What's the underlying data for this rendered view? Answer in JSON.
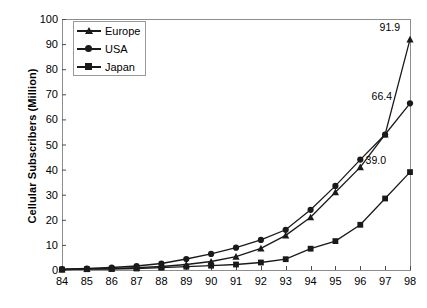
{
  "chart_data": {
    "type": "line",
    "title": "",
    "xlabel": "",
    "ylabel": "Cellular Subscribers (Million)",
    "x": [
      "84",
      "85",
      "86",
      "87",
      "88",
      "89",
      "90",
      "91",
      "92",
      "93",
      "94",
      "95",
      "96",
      "97",
      "98"
    ],
    "xlim": [
      84,
      98
    ],
    "ylim": [
      0,
      100
    ],
    "yticks": [
      "0",
      "10",
      "20",
      "30",
      "40",
      "50",
      "60",
      "70",
      "80",
      "90",
      "100"
    ],
    "ytick_values": [
      0,
      10,
      20,
      30,
      40,
      50,
      60,
      70,
      80,
      90,
      100
    ],
    "grid": false,
    "legend_position": "top-left-inside",
    "series": [
      {
        "name": "Europe",
        "marker": "triangle",
        "color": "#1a1a1a",
        "values": [
          0.2,
          0.4,
          0.6,
          0.9,
          1.4,
          2.2,
          3.4,
          5.3,
          8.6,
          13.8,
          21.0,
          31.0,
          41.0,
          54.0,
          91.9
        ],
        "end_label": "91.9"
      },
      {
        "name": "USA",
        "marker": "circle",
        "color": "#1a1a1a",
        "values": [
          0.3,
          0.6,
          1.0,
          1.6,
          2.6,
          4.4,
          6.4,
          8.9,
          12.0,
          16.0,
          24.0,
          33.5,
          44.0,
          54.0,
          66.4
        ],
        "end_label": "66.4"
      },
      {
        "name": "Japan",
        "marker": "square",
        "color": "#1a1a1a",
        "values": [
          0.2,
          0.3,
          0.4,
          0.6,
          0.9,
          1.3,
          1.7,
          2.2,
          3.0,
          4.3,
          8.5,
          11.5,
          18.0,
          28.5,
          39.0
        ],
        "end_label": "39.0"
      }
    ],
    "annotations": [
      {
        "text": "91.9",
        "series": "Europe",
        "x": "98"
      },
      {
        "text": "66.4",
        "series": "USA",
        "x": "98"
      },
      {
        "text": "39.0",
        "series": "Japan",
        "x": "98"
      }
    ]
  },
  "legend": {
    "items": [
      {
        "label": "Europe",
        "marker": "triangle"
      },
      {
        "label": "USA",
        "marker": "circle"
      },
      {
        "label": "Japan",
        "marker": "square"
      }
    ]
  }
}
